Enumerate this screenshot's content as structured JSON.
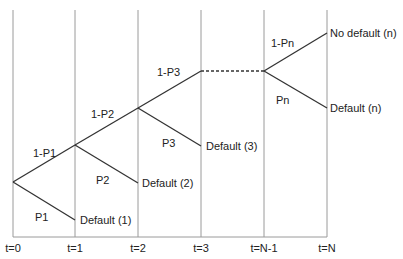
{
  "diagram": {
    "type": "default-probability-tree",
    "time_labels": [
      "t=0",
      "t=1",
      "t=2",
      "t=3",
      "t=N-1",
      "t=N"
    ],
    "branch_labels": {
      "survive_1": "1-P1",
      "default_1": "P1",
      "survive_2": "1-P2",
      "default_2": "P2",
      "survive_3": "1-P3",
      "default_3": "P3",
      "survive_n": "1-Pn",
      "default_n": "Pn"
    },
    "outcome_labels": {
      "default_1": "Default (1)",
      "default_2": "Default (2)",
      "default_3": "Default (3)",
      "no_default_n": "No default (n)",
      "default_n": "Default (n)"
    },
    "colors": {
      "grid": "#9a9a9a",
      "branch": "#333333",
      "text": "#222222"
    }
  }
}
